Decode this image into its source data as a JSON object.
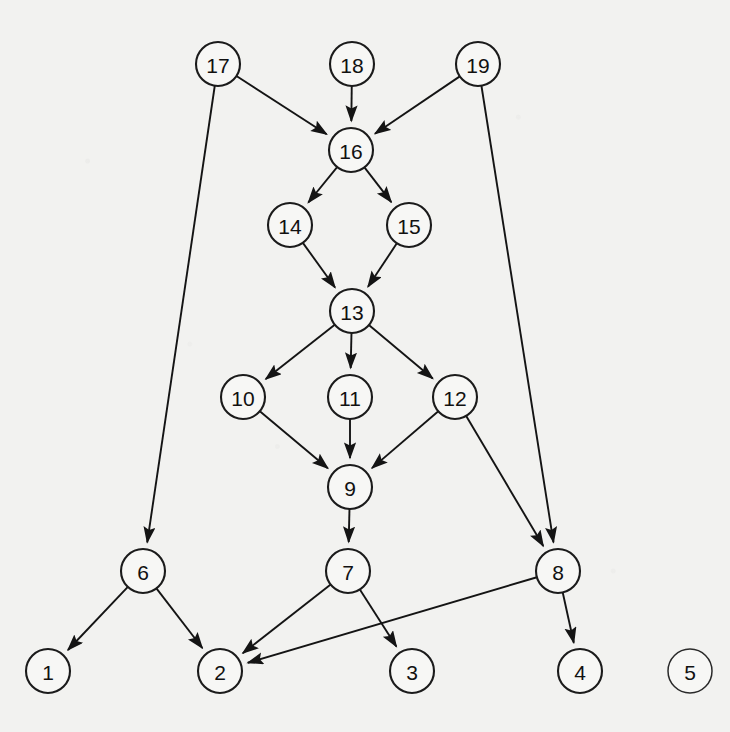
{
  "figure": {
    "background_color": "#f2f2f0",
    "node_fill": "#f7f7f5",
    "node_stroke": "#1b1b1b",
    "edge_color": "#141414",
    "node_radius": 22
  },
  "graph": {
    "type": "directed-graph",
    "node_count": 19,
    "edge_count": 23,
    "nodes": [
      {
        "id": 1,
        "label": "1",
        "x": 48,
        "y": 671,
        "isolated": false
      },
      {
        "id": 2,
        "label": "2",
        "x": 220,
        "y": 671,
        "isolated": false
      },
      {
        "id": 3,
        "label": "3",
        "x": 412,
        "y": 671,
        "isolated": false
      },
      {
        "id": 4,
        "label": "4",
        "x": 580,
        "y": 671,
        "isolated": false
      },
      {
        "id": 5,
        "label": "5",
        "x": 690,
        "y": 671,
        "isolated": true
      },
      {
        "id": 6,
        "label": "6",
        "x": 143,
        "y": 571,
        "isolated": false
      },
      {
        "id": 7,
        "label": "7",
        "x": 348,
        "y": 571,
        "isolated": false
      },
      {
        "id": 8,
        "label": "8",
        "x": 558,
        "y": 571,
        "isolated": false
      },
      {
        "id": 9,
        "label": "9",
        "x": 350,
        "y": 487,
        "isolated": false
      },
      {
        "id": 10,
        "label": "10",
        "x": 243,
        "y": 397,
        "isolated": false
      },
      {
        "id": 11,
        "label": "11",
        "x": 350,
        "y": 397,
        "isolated": false
      },
      {
        "id": 12,
        "label": "12",
        "x": 455,
        "y": 397,
        "isolated": false
      },
      {
        "id": 13,
        "label": "13",
        "x": 352,
        "y": 311,
        "isolated": false
      },
      {
        "id": 14,
        "label": "14",
        "x": 290,
        "y": 225,
        "isolated": false
      },
      {
        "id": 15,
        "label": "15",
        "x": 409,
        "y": 225,
        "isolated": false
      },
      {
        "id": 16,
        "label": "16",
        "x": 351,
        "y": 150,
        "isolated": false
      },
      {
        "id": 17,
        "label": "17",
        "x": 218,
        "y": 64,
        "isolated": false
      },
      {
        "id": 18,
        "label": "18",
        "x": 352,
        "y": 64,
        "isolated": false
      },
      {
        "id": 19,
        "label": "19",
        "x": 478,
        "y": 64,
        "isolated": false
      }
    ],
    "edges": [
      {
        "from": 17,
        "to": 16
      },
      {
        "from": 17,
        "to": 6
      },
      {
        "from": 18,
        "to": 16
      },
      {
        "from": 19,
        "to": 16
      },
      {
        "from": 19,
        "to": 8
      },
      {
        "from": 16,
        "to": 14
      },
      {
        "from": 16,
        "to": 15
      },
      {
        "from": 14,
        "to": 13
      },
      {
        "from": 15,
        "to": 13
      },
      {
        "from": 13,
        "to": 10
      },
      {
        "from": 13,
        "to": 11
      },
      {
        "from": 13,
        "to": 12
      },
      {
        "from": 10,
        "to": 9
      },
      {
        "from": 11,
        "to": 9
      },
      {
        "from": 12,
        "to": 9
      },
      {
        "from": 12,
        "to": 8
      },
      {
        "from": 9,
        "to": 7
      },
      {
        "from": 6,
        "to": 1
      },
      {
        "from": 6,
        "to": 2
      },
      {
        "from": 7,
        "to": 2
      },
      {
        "from": 7,
        "to": 3
      },
      {
        "from": 8,
        "to": 2
      },
      {
        "from": 8,
        "to": 4
      }
    ]
  }
}
